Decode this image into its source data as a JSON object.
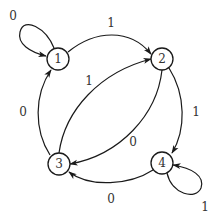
{
  "diagram": {
    "type": "state-transition-graph",
    "nodes": [
      {
        "id": "1",
        "label": "1",
        "x": 58,
        "y": 59
      },
      {
        "id": "2",
        "label": "2",
        "x": 162,
        "y": 59
      },
      {
        "id": "3",
        "label": "3",
        "x": 59,
        "y": 164
      },
      {
        "id": "4",
        "label": "4",
        "x": 162,
        "y": 163
      }
    ],
    "edges": [
      {
        "from": "1",
        "to": "1",
        "label": "0"
      },
      {
        "from": "1",
        "to": "2",
        "label": "1"
      },
      {
        "from": "3",
        "to": "2",
        "label": "1"
      },
      {
        "from": "2",
        "to": "3",
        "label": "0"
      },
      {
        "from": "3",
        "to": "1",
        "label": "0"
      },
      {
        "from": "2",
        "to": "4",
        "label": "1"
      },
      {
        "from": "4",
        "to": "3",
        "label": "0"
      },
      {
        "from": "4",
        "to": "4",
        "label": "1"
      }
    ],
    "colors": {
      "stroke": "#1a1a1a",
      "text": "#333333",
      "background": "#ffffff"
    }
  }
}
